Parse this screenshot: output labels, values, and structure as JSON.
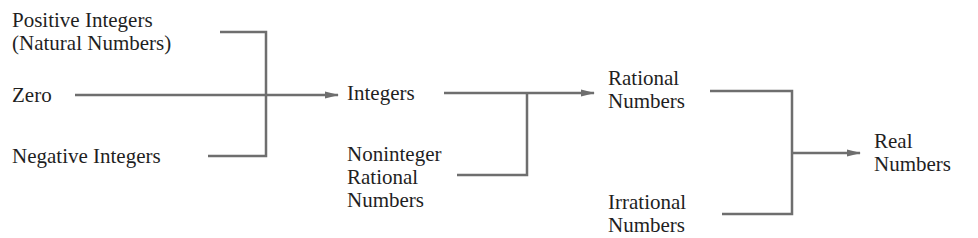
{
  "diagram": {
    "title_fragment": "...",
    "nodes": {
      "positive_integers": {
        "line1": "Positive Integers",
        "line2": "(Natural Numbers)"
      },
      "zero": {
        "line1": "Zero"
      },
      "negative_integers": {
        "line1": "Negative Integers"
      },
      "integers": {
        "line1": "Integers"
      },
      "noninteger_rational": {
        "line1": "Noninteger",
        "line2": "Rational",
        "line3": "Numbers"
      },
      "rational_numbers": {
        "line1": "Rational",
        "line2": "Numbers"
      },
      "irrational_numbers": {
        "line1": "Irrational",
        "line2": "Numbers"
      },
      "real_numbers": {
        "line1": "Real",
        "line2": "Numbers"
      }
    },
    "edges": [
      {
        "from": [
          "Positive Integers",
          "Zero",
          "Negative Integers"
        ],
        "to": "Integers"
      },
      {
        "from": [
          "Integers",
          "Noninteger Rational Numbers"
        ],
        "to": "Rational Numbers"
      },
      {
        "from": [
          "Rational Numbers",
          "Irrational Numbers"
        ],
        "to": "Real Numbers"
      }
    ],
    "line_color": "#6e6e6e"
  }
}
